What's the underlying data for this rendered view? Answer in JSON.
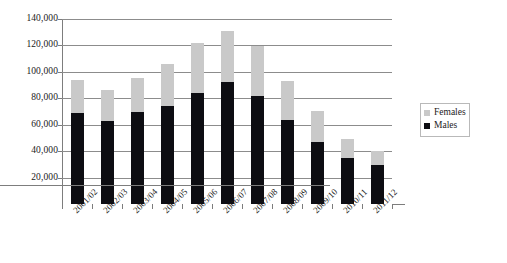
{
  "chart_data": {
    "type": "bar",
    "subtype": "stacked-vertical",
    "title": "",
    "xlabel": "",
    "ylabel": "",
    "ylim": [
      0,
      140000
    ],
    "ytick_step": 20000,
    "ytick_labels": [
      "140,000",
      "120,000",
      "100,000",
      "80,000",
      "60,000",
      "40,000",
      "20,000"
    ],
    "ytick_values": [
      140000,
      120000,
      100000,
      80000,
      60000,
      40000,
      20000
    ],
    "grid": true,
    "grid_axis": "y",
    "legend_position": "right",
    "categories": [
      "2001/02",
      "2002/03",
      "2003/04",
      "2004/05",
      "2005/06",
      "2006/07",
      "2007/08",
      "2008/09",
      "2009/10",
      "2010/11",
      "2011/12"
    ],
    "series": [
      {
        "name": "Males",
        "color": "#0d0d12",
        "values": [
          69000,
          62500,
          70000,
          74000,
          84000,
          92000,
          82000,
          63500,
          47000,
          35000,
          29500
        ]
      },
      {
        "name": "Females",
        "color": "#c9c9c9",
        "values": [
          25000,
          23500,
          25500,
          32000,
          37500,
          39000,
          37500,
          29500,
          23500,
          14000,
          10500
        ]
      }
    ],
    "totals": [
      94000,
      86000,
      95500,
      106000,
      121500,
      131000,
      119500,
      93000,
      70500,
      49000,
      40000
    ]
  },
  "legend": {
    "items": [
      {
        "label": "Females",
        "swatch": "females"
      },
      {
        "label": "Males",
        "swatch": "males"
      }
    ]
  },
  "colors": {
    "males": "#0d0d12",
    "females": "#c9c9c9",
    "gridline": "#8c8c8c",
    "axis": "#7d7d7d",
    "background": "#ffffff",
    "text": "#1a1a1a"
  }
}
